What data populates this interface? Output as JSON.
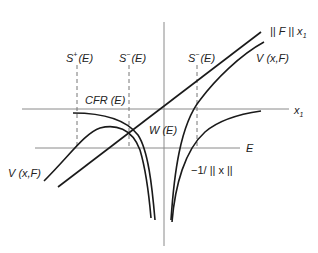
{
  "diagram": {
    "labels": {
      "s_plus": {
        "base": "S",
        "sup": "+",
        "rest": "(E)"
      },
      "s_minus_left": {
        "base": "S",
        "sup": "−",
        "rest": "(E)"
      },
      "s_minus_right": {
        "base": "S",
        "sup": "−",
        "rest": "(E)"
      },
      "cfr": "CFR (E)",
      "w": "W (E)",
      "norm_f": {
        "text": "|| F || x",
        "sub": "1"
      },
      "v_right": "V (x,F)",
      "v_left": "V (x,F)",
      "x1_axis": {
        "base": "x",
        "sub": "1"
      },
      "e_axis": "E",
      "inv_norm": "−1/ || x ||"
    },
    "colors": {
      "axis": "#8a8a8a",
      "curve": "#1a1a1a",
      "dash": "#777777",
      "text": "#222222"
    }
  }
}
